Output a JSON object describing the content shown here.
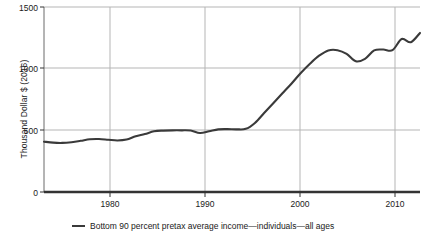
{
  "chart_data": {
    "type": "line",
    "title": "",
    "xlabel": "",
    "ylabel": "Thousand Dollar $ (2016)",
    "xlim": [
      1974,
      2015
    ],
    "ylim": [
      0,
      1500
    ],
    "yticks": [
      0,
      500,
      1000,
      1500
    ],
    "ytick_labels": [
      "0",
      "500",
      "1000",
      "1500"
    ],
    "xticks": [
      1980,
      1990,
      2000,
      2010
    ],
    "xtick_labels": [
      "1980",
      "1990",
      "2000",
      "2010"
    ],
    "grid": true,
    "legend_position": "bottom",
    "line_color": "#3a3a3a",
    "grid_color": "#b5b5b5",
    "series": [
      {
        "name": "Bottom 90 percent pretax average income—individuals—all ages",
        "x": [
          1974,
          1975,
          1976,
          1977,
          1978,
          1979,
          1980,
          1981,
          1982,
          1983,
          1984,
          1985,
          1986,
          1987,
          1988,
          1989,
          1990,
          1991,
          1992,
          1993,
          1994,
          1995,
          1996,
          1997,
          1998,
          1999,
          2000,
          2001,
          2002,
          2003,
          2004,
          2005,
          2006,
          2007,
          2008,
          2009,
          2010,
          2011,
          2012,
          2013,
          2014,
          2015
        ],
        "values": [
          408,
          400,
          398,
          404,
          415,
          428,
          430,
          424,
          418,
          425,
          452,
          470,
          492,
          498,
          500,
          500,
          498,
          478,
          492,
          508,
          510,
          508,
          512,
          560,
          640,
          720,
          800,
          880,
          965,
          1040,
          1105,
          1148,
          1150,
          1120,
          1060,
          1080,
          1148,
          1155,
          1150,
          1240,
          1215,
          1290
        ]
      }
    ]
  },
  "legend": {
    "entries": [
      {
        "label": "Bottom 90 percent pretax average income—individuals—all ages",
        "swatch_name": "legend-line-swatch"
      }
    ]
  }
}
